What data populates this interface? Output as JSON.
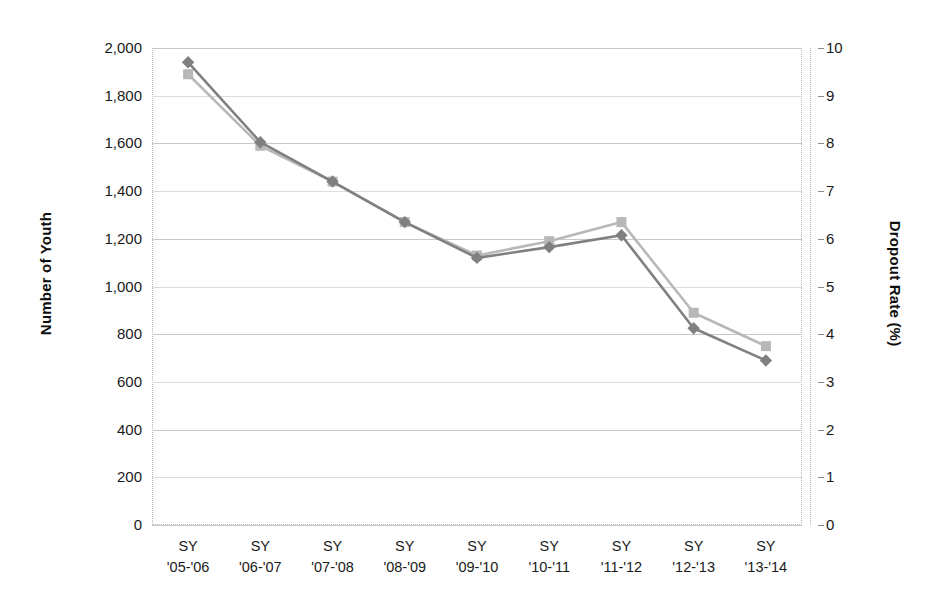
{
  "chart_data": {
    "type": "line",
    "title": "",
    "categories": [
      "SY '05-'06",
      "SY '06-'07",
      "SY '07-'08",
      "SY '08-'09",
      "SY '09-'10",
      "SY '10-'11",
      "SY '11-'12",
      "SY '12-'13",
      "SY '13-'14"
    ],
    "categories_lines": [
      [
        "SY",
        "'05-'06"
      ],
      [
        "SY",
        "'06-'07"
      ],
      [
        "SY",
        "'07-'08"
      ],
      [
        "SY",
        "'08-'09"
      ],
      [
        "SY",
        "'09-'10"
      ],
      [
        "SY",
        "'10-'11"
      ],
      [
        "SY",
        "'11-'12"
      ],
      [
        "SY",
        "'12-'13"
      ],
      [
        "SY",
        "'13-'14"
      ]
    ],
    "xlabel": "",
    "ylabel": "Number of Youth",
    "y2label": "Dropout Rate (%)",
    "ylim": [
      0,
      2000
    ],
    "y2lim": [
      0,
      10
    ],
    "ytick_step": 200,
    "y2tick_step": 1,
    "yticks": [
      "0",
      "200",
      "400",
      "600",
      "800",
      "1,000",
      "1,200",
      "1,400",
      "1,600",
      "1,800",
      "2,000"
    ],
    "ytick_values": [
      0,
      200,
      400,
      600,
      800,
      1000,
      1200,
      1400,
      1600,
      1800,
      2000
    ],
    "y2ticks": [
      "0",
      "1",
      "2",
      "3",
      "4",
      "5",
      "6",
      "7",
      "8",
      "9",
      "10"
    ],
    "y2tick_values": [
      0,
      1,
      2,
      3,
      4,
      5,
      6,
      7,
      8,
      9,
      10
    ],
    "grid": true,
    "legend": "none",
    "series": [
      {
        "name": "Number of Youth",
        "axis": "left",
        "marker": "diamond",
        "color": "#808080",
        "values": [
          1940,
          1605,
          1440,
          1270,
          1120,
          1165,
          1215,
          825,
          690
        ]
      },
      {
        "name": "Dropout Rate (%)",
        "axis": "right",
        "marker": "square",
        "color": "#b8b8b8",
        "values": [
          9.45,
          7.95,
          7.2,
          6.35,
          5.65,
          5.95,
          6.35,
          4.45,
          3.75
        ]
      }
    ]
  },
  "colors": {
    "series_dark": "#808080",
    "series_light": "#b8b8b8",
    "gridline": "#c8c8c8",
    "plot_border": "#b5b5b5",
    "text": "#1a1a1a"
  }
}
